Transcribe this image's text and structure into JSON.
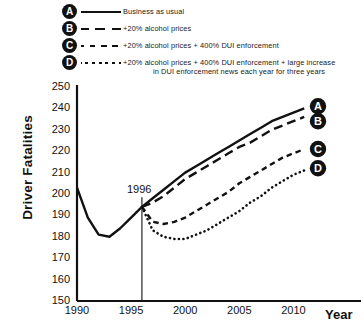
{
  "chart_data": {
    "type": "line",
    "title": "",
    "xlabel": "Year",
    "ylabel": "Driver Fatalities",
    "xlim": [
      1990,
      2011.5
    ],
    "ylim": [
      150,
      250
    ],
    "yticks": [
      250,
      240,
      230,
      220,
      210,
      200,
      190,
      180,
      170,
      160,
      150
    ],
    "xticks": [
      1990,
      1995,
      2000,
      2005,
      2010
    ],
    "grid": false,
    "legend_position": "top",
    "annotations": [
      {
        "text": "1996",
        "x": 1996,
        "type": "vertical-line-label"
      }
    ],
    "series": [
      {
        "name": "A",
        "label": "Business as usual",
        "style": "solid",
        "marker_label": "A",
        "x": [
          1990,
          1991,
          1992,
          1993,
          1994,
          1995,
          1996,
          1997,
          1998,
          1999,
          2000,
          2001,
          2002,
          2003,
          2004,
          2005,
          2006,
          2007,
          2008,
          2009,
          2010,
          2011
        ],
        "values": [
          203,
          189,
          181,
          180,
          184,
          189,
          194,
          198,
          202,
          206,
          210,
          213,
          216,
          219,
          222,
          225,
          228,
          231,
          234,
          236,
          238,
          240
        ]
      },
      {
        "name": "B",
        "label": "+20% alcohol prices",
        "style": "dashed-long",
        "marker_label": "B",
        "x": [
          1996,
          1997,
          1998,
          1999,
          2000,
          2001,
          2002,
          2003,
          2004,
          2005,
          2006,
          2007,
          2008,
          2009,
          2010,
          2011
        ],
        "values": [
          194,
          196,
          199,
          203,
          207,
          210,
          213,
          216,
          219,
          222,
          224,
          227,
          230,
          232,
          234,
          236
        ]
      },
      {
        "name": "C",
        "label": "+20% alcohol prices + 400% DUI enforcement",
        "style": "dashed-short",
        "marker_label": "C",
        "x": [
          1996,
          1997,
          1998,
          1999,
          2000,
          2001,
          2002,
          2003,
          2004,
          2005,
          2006,
          2007,
          2008,
          2009,
          2010,
          2011
        ],
        "values": [
          194,
          187,
          186,
          187,
          189,
          192,
          195,
          198,
          201,
          205,
          208,
          211,
          214,
          217,
          219,
          221
        ]
      },
      {
        "name": "D",
        "label": "+20% alcohol prices + 400% DUI enforcement + large increase in DUI enforcement news each year for three years",
        "label_line1": "+20% alcohol prices + 400% DUI enforcement + large increase",
        "label_line2": "in DUI enforcement news each year for three years",
        "style": "dotted",
        "marker_label": "D",
        "x": [
          1996,
          1997,
          1998,
          1999,
          2000,
          2001,
          2002,
          2003,
          2004,
          2005,
          2006,
          2007,
          2008,
          2009,
          2010,
          2011
        ],
        "values": [
          194,
          183,
          180,
          179,
          179,
          181,
          183,
          186,
          189,
          192,
          196,
          199,
          203,
          206,
          209,
          211
        ]
      }
    ]
  },
  "legend": {
    "items": [
      {
        "badge": "A",
        "style": "solid",
        "label": "Business as usual"
      },
      {
        "badge": "B",
        "style": "dashed-long",
        "label": "+20% alcohol prices"
      },
      {
        "badge": "C",
        "style": "dashed-short",
        "label": "+20% alcohol prices + 400% DUI enforcement"
      },
      {
        "badge": "D",
        "style": "dotted",
        "label_line1": "+20% alcohol prices + 400% DUI enforcement + large increase",
        "label_line2": "in DUI enforcement news each year for three years"
      }
    ]
  },
  "axes": {
    "y_title": "Driver Fatalities",
    "x_title": "Year"
  },
  "colors": {
    "line": "#111111",
    "background": "#ffffff",
    "text": "#111111"
  }
}
